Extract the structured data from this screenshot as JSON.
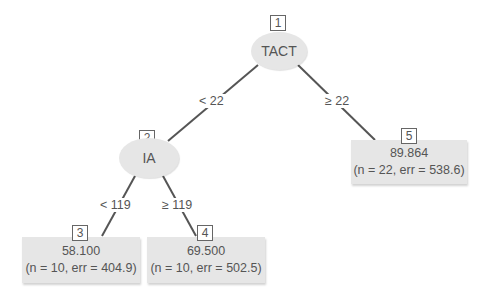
{
  "tree": {
    "nodes": [
      {
        "id": "1",
        "type": "split",
        "variable": "TACT"
      },
      {
        "id": "2",
        "type": "split",
        "variable": "IA"
      },
      {
        "id": "3",
        "type": "leaf",
        "value": "58.100",
        "stats": "(n = 10, err = 404.9)"
      },
      {
        "id": "4",
        "type": "leaf",
        "value": "69.500",
        "stats": "(n = 10, err = 502.5)"
      },
      {
        "id": "5",
        "type": "leaf",
        "value": "89.864",
        "stats": "(n = 22, err = 538.6)"
      }
    ],
    "edges": [
      {
        "from": "1",
        "to": "2",
        "label": "< 22"
      },
      {
        "from": "1",
        "to": "5",
        "label": "≥ 22"
      },
      {
        "from": "2",
        "to": "3",
        "label": "< 119"
      },
      {
        "from": "2",
        "to": "4",
        "label": "≥ 119"
      }
    ]
  },
  "colors": {
    "node_fill": "#e6e6e6",
    "edge": "#555555",
    "text": "#555555"
  }
}
